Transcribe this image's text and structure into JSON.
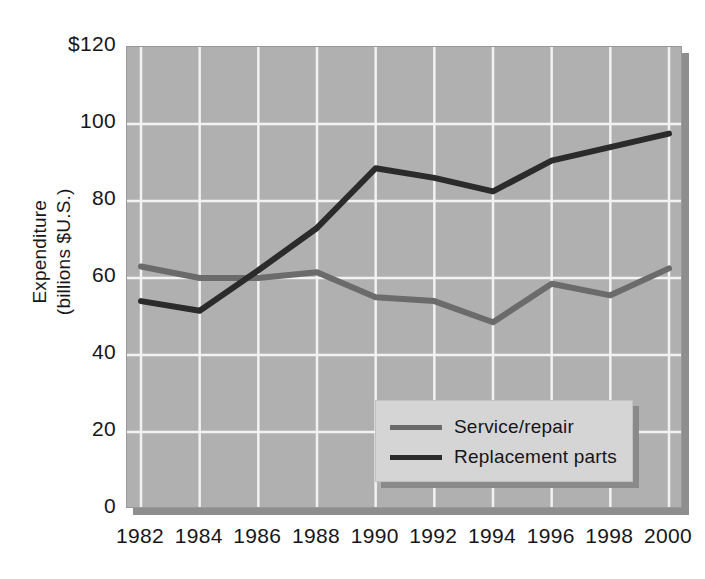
{
  "chart_data": {
    "type": "line",
    "title": "",
    "subtitle": "",
    "xlabel": "",
    "ylabel": "Expenditure\n(billions $U.S.)",
    "x": [
      1982,
      1984,
      1986,
      1988,
      1990,
      1992,
      1994,
      1996,
      1998,
      2000
    ],
    "x_tick_labels": [
      "1982",
      "1984",
      "1986",
      "1988",
      "1990",
      "1992",
      "1994",
      "1996",
      "1998",
      "2000"
    ],
    "y_tick_labels": [
      "$120",
      "100",
      "80",
      "60",
      "40",
      "20",
      "0"
    ],
    "y_ticks": [
      120,
      100,
      80,
      60,
      40,
      20,
      0
    ],
    "ylim": [
      0,
      120
    ],
    "xlim": [
      1982,
      2000
    ],
    "grid": true,
    "legend_position": "lower right",
    "series": [
      {
        "name": "Service/repair",
        "color": "#6b6b6b",
        "values": [
          63,
          60,
          60,
          61.5,
          55,
          54,
          48.5,
          58.5,
          55.5,
          62.5
        ]
      },
      {
        "name": "Replacement parts",
        "color": "#2b2b2b",
        "values": [
          54,
          51.5,
          62,
          73,
          88.5,
          86,
          82.5,
          90.5,
          94,
          97.5
        ]
      }
    ],
    "plot_background": "#b0b0b0",
    "grid_color": "#f2f2f2",
    "legend_background": "#d5d5d5"
  }
}
